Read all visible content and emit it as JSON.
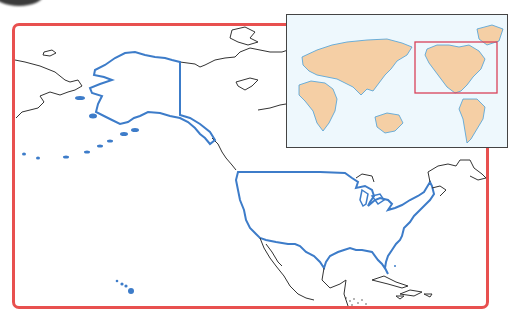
{
  "map": {
    "title": "",
    "subject": "United States (contiguous, Alaska, Hawaii)",
    "colors": {
      "frame_border": "#e8504f",
      "us_outline": "#3d7cc9",
      "neighbor_outline": "#333333",
      "inset_land": "#f5cfa5",
      "inset_water": "#eef8fd",
      "inset_coast": "#4a9fd8",
      "inset_highlight": "#d9415a"
    },
    "inset": {
      "label": "",
      "description": "World map locator with highlighted North America region"
    }
  }
}
